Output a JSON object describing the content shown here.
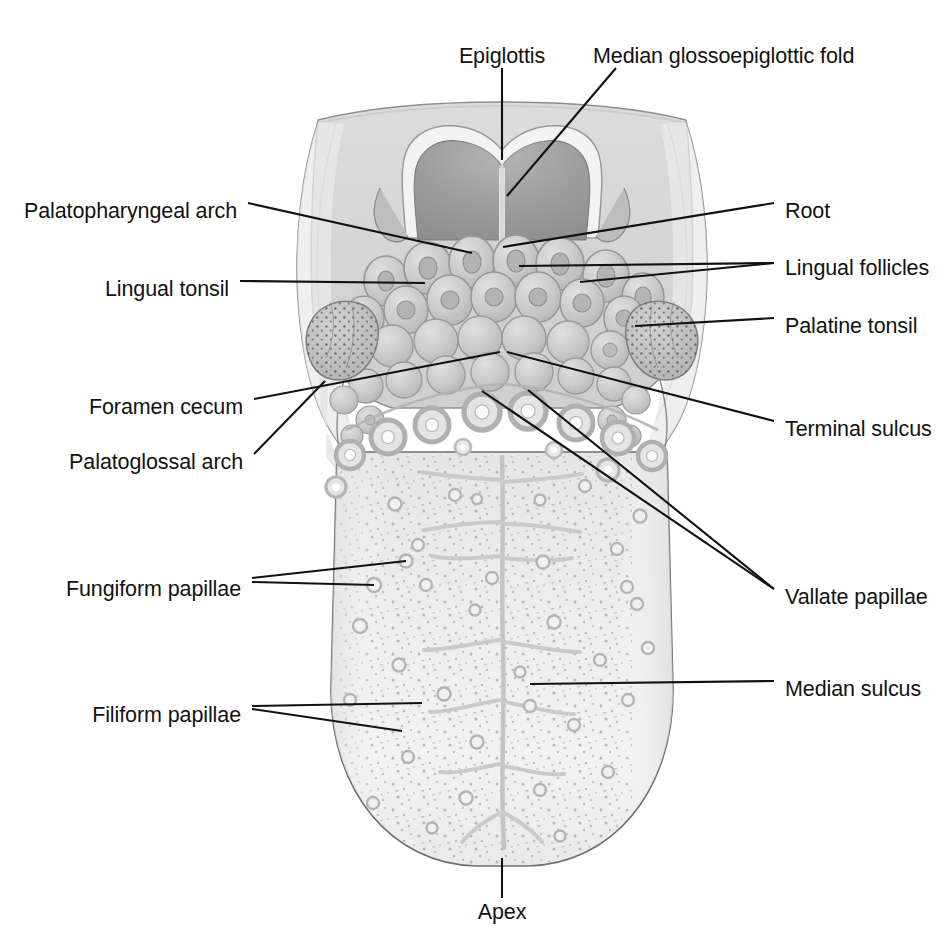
{
  "figure": {
    "type": "anatomical-illustration",
    "view": "superior (dorsal) surface",
    "palette": {
      "background": "#ffffff",
      "leader_line": "#111111",
      "text": "#121212",
      "outline": "#6d6d6d",
      "body_fill": "#ececec",
      "body_fill_light": "#f3f3f3",
      "root_fill": "#d9d9d9",
      "root_fill_dark": "#cfcfcf",
      "epiglottis_fill": "#9a9a9a",
      "epiglottis_rim": "#f2f2f2",
      "follicle_fill": "#c9c9c9",
      "follicle_edge": "#9b9b9b",
      "vallate_ring": "#b9b9b9",
      "vallate_center": "#fbfbfb",
      "palatine_tonsil_fill": "#c0c0c0",
      "sulcus_line": "#c2c2c2",
      "filiform_speck": "#a9a9a9"
    }
  },
  "labels": [
    {
      "id": "epiglottis",
      "text": "Epiglottis",
      "align": "center",
      "x": 502,
      "y": 55,
      "anchor_x": 502,
      "anchor_y": 68
    },
    {
      "id": "median-glossoepiglottic-fold",
      "text": "Median glossoepiglottic fold",
      "align": "left",
      "x": 593,
      "y": 55,
      "anchor_x": 621,
      "anchor_y": 68
    },
    {
      "id": "palatopharyngeal-arch",
      "text": "Palatopharyngeal arch",
      "align": "right",
      "x": 237,
      "y": 210,
      "anchor_x": 248,
      "anchor_y": 203
    },
    {
      "id": "lingual-tonsil",
      "text": "Lingual tonsil",
      "align": "right",
      "x": 229,
      "y": 288,
      "anchor_x": 240,
      "anchor_y": 281
    },
    {
      "id": "foramen-cecum",
      "text": "Foramen cecum",
      "align": "right",
      "x": 243,
      "y": 406,
      "anchor_x": 254,
      "anchor_y": 399
    },
    {
      "id": "palatoglossal-arch",
      "text": "Palatoglossal arch",
      "align": "right",
      "x": 243,
      "y": 461,
      "anchor_x": 254,
      "anchor_y": 454
    },
    {
      "id": "fungiform-papillae",
      "text": "Fungiform papillae",
      "align": "right",
      "x": 241,
      "y": 588,
      "anchor_x": 252,
      "anchor_y": 581
    },
    {
      "id": "filiform-papillae",
      "text": "Filiform papillae",
      "align": "right",
      "x": 241,
      "y": 714,
      "anchor_x": 252,
      "anchor_y": 707
    },
    {
      "id": "root",
      "text": "Root",
      "align": "left",
      "x": 785,
      "y": 210,
      "anchor_x": 774,
      "anchor_y": 203
    },
    {
      "id": "lingual-follicles",
      "text": "Lingual follicles",
      "align": "left",
      "x": 785,
      "y": 267,
      "anchor_x": 774,
      "anchor_y": 260
    },
    {
      "id": "palatine-tonsil",
      "text": "Palatine tonsil",
      "align": "left",
      "x": 785,
      "y": 325,
      "anchor_x": 774,
      "anchor_y": 318
    },
    {
      "id": "terminal-sulcus",
      "text": "Terminal sulcus",
      "align": "left",
      "x": 785,
      "y": 428,
      "anchor_x": 774,
      "anchor_y": 421
    },
    {
      "id": "vallate-papillae",
      "text": "Vallate papillae",
      "align": "left",
      "x": 785,
      "y": 596,
      "anchor_x": 774,
      "anchor_y": 589
    },
    {
      "id": "median-sulcus",
      "text": "Median sulcus",
      "align": "left",
      "x": 785,
      "y": 688,
      "anchor_x": 774,
      "anchor_y": 681
    },
    {
      "id": "apex",
      "text": "Apex",
      "align": "center",
      "x": 502,
      "y": 911,
      "anchor_x": 502,
      "anchor_y": 898
    }
  ],
  "leaders": [
    {
      "id": "leader-epiglottis",
      "points": "502,68 502,160"
    },
    {
      "id": "leader-median-glossoepiglottic-fold",
      "points": "616,68 507,196"
    },
    {
      "id": "leader-palatopharyngeal-arch",
      "points": "248,203 472,253"
    },
    {
      "id": "leader-lingual-tonsil",
      "points": "240,281 425,283"
    },
    {
      "id": "leader-foramen-cecum",
      "points": "254,399 500,352"
    },
    {
      "id": "leader-palatoglossal-arch",
      "points": "254,454 325,381"
    },
    {
      "id": "leader-fungiform-papillae-a",
      "points": "252,578 406,561"
    },
    {
      "id": "leader-fungiform-papillae-b",
      "points": "252,582 374,585"
    },
    {
      "id": "leader-filiform-papillae-a",
      "points": "252,706 422,703"
    },
    {
      "id": "leader-filiform-papillae-b",
      "points": "252,709 402,731"
    },
    {
      "id": "leader-root",
      "points": "774,203 503,247"
    },
    {
      "id": "leader-lingual-follicles-a",
      "points": "774,263 519,266"
    },
    {
      "id": "leader-lingual-follicles-b",
      "points": "774,263 580,282"
    },
    {
      "id": "leader-palatine-tonsil",
      "points": "774,318 635,326"
    },
    {
      "id": "leader-terminal-sulcus",
      "points": "774,421 507,352"
    },
    {
      "id": "leader-vallate-papillae-a",
      "points": "774,589 482,391"
    },
    {
      "id": "leader-vallate-papillae-b",
      "points": "774,589 528,390"
    },
    {
      "id": "leader-median-sulcus",
      "points": "774,681 530,684"
    },
    {
      "id": "leader-apex",
      "points": "502,898 502,858"
    }
  ],
  "structures": [
    {
      "id": "root-of-tongue",
      "name": "Root of tongue",
      "region": "posterior"
    },
    {
      "id": "epiglottis",
      "name": "Epiglottis",
      "region": "posterior-midline"
    },
    {
      "id": "lingual-tonsil",
      "name": "Lingual tonsil",
      "region": "posterior"
    },
    {
      "id": "palatine-tonsil",
      "name": "Palatine tonsil",
      "region": "lateral"
    },
    {
      "id": "terminal-sulcus",
      "name": "Terminal sulcus",
      "region": "mid"
    },
    {
      "id": "vallate-papillae",
      "name": "Vallate papillae",
      "region": "mid",
      "count": 11
    },
    {
      "id": "fungiform-papillae",
      "name": "Fungiform papillae",
      "region": "body"
    },
    {
      "id": "filiform-papillae",
      "name": "Filiform papillae",
      "region": "body"
    },
    {
      "id": "median-sulcus",
      "name": "Median sulcus",
      "region": "body-midline"
    },
    {
      "id": "apex-of-tongue",
      "name": "Apex of tongue",
      "region": "anterior"
    }
  ]
}
